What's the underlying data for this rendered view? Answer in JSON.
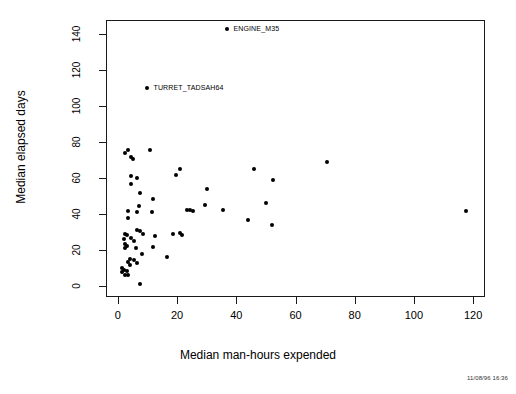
{
  "chart_data": {
    "type": "scatter",
    "title": "",
    "xlabel": "Median man-hours expended",
    "ylabel": "Median elapsed days",
    "xlim": [
      -4,
      124
    ],
    "ylim": [
      -6,
      148
    ],
    "xticks": [
      0,
      20,
      40,
      60,
      80,
      100,
      120
    ],
    "yticks": [
      0,
      20,
      40,
      60,
      80,
      100,
      120,
      140
    ],
    "grid": false,
    "legend": null,
    "marker": "filled-circle",
    "marker_color": "#000000",
    "points": [
      {
        "x": 37.0,
        "y": 143.0,
        "label": "ENGINE_M35"
      },
      {
        "x": 10.0,
        "y": 110.0,
        "label": "TURRET_TADSAH64"
      },
      {
        "x": 11.0,
        "y": 76.0,
        "label": ""
      },
      {
        "x": 3.5,
        "y": 76.0,
        "label": ""
      },
      {
        "x": 2.5,
        "y": 74.0,
        "label": ""
      },
      {
        "x": 4.5,
        "y": 72.0,
        "label": ""
      },
      {
        "x": 5.0,
        "y": 70.5,
        "label": ""
      },
      {
        "x": 70.5,
        "y": 69.0,
        "label": ""
      },
      {
        "x": 21.0,
        "y": 65.0,
        "label": ""
      },
      {
        "x": 46.0,
        "y": 65.0,
        "label": ""
      },
      {
        "x": 19.5,
        "y": 62.0,
        "label": ""
      },
      {
        "x": 4.5,
        "y": 61.0,
        "label": ""
      },
      {
        "x": 6.5,
        "y": 60.0,
        "label": ""
      },
      {
        "x": 52.5,
        "y": 59.0,
        "label": ""
      },
      {
        "x": 4.5,
        "y": 57.0,
        "label": ""
      },
      {
        "x": 30.0,
        "y": 54.0,
        "label": ""
      },
      {
        "x": 7.5,
        "y": 52.0,
        "label": ""
      },
      {
        "x": 12.0,
        "y": 48.5,
        "label": ""
      },
      {
        "x": 50.0,
        "y": 46.0,
        "label": ""
      },
      {
        "x": 29.5,
        "y": 45.0,
        "label": ""
      },
      {
        "x": 7.0,
        "y": 44.5,
        "label": ""
      },
      {
        "x": 23.5,
        "y": 42.5,
        "label": ""
      },
      {
        "x": 24.5,
        "y": 42.5,
        "label": ""
      },
      {
        "x": 25.5,
        "y": 42.0,
        "label": ""
      },
      {
        "x": 35.5,
        "y": 42.5,
        "label": ""
      },
      {
        "x": 117.5,
        "y": 42.0,
        "label": ""
      },
      {
        "x": 3.5,
        "y": 42.0,
        "label": ""
      },
      {
        "x": 11.5,
        "y": 41.5,
        "label": ""
      },
      {
        "x": 6.5,
        "y": 41.0,
        "label": ""
      },
      {
        "x": 3.5,
        "y": 38.0,
        "label": ""
      },
      {
        "x": 44.0,
        "y": 37.0,
        "label": ""
      },
      {
        "x": 52.0,
        "y": 34.0,
        "label": ""
      },
      {
        "x": 6.5,
        "y": 31.0,
        "label": ""
      },
      {
        "x": 7.5,
        "y": 30.5,
        "label": ""
      },
      {
        "x": 2.5,
        "y": 29.0,
        "label": ""
      },
      {
        "x": 3.0,
        "y": 28.5,
        "label": ""
      },
      {
        "x": 8.5,
        "y": 29.0,
        "label": ""
      },
      {
        "x": 12.5,
        "y": 28.0,
        "label": ""
      },
      {
        "x": 18.5,
        "y": 29.0,
        "label": ""
      },
      {
        "x": 21.0,
        "y": 29.5,
        "label": ""
      },
      {
        "x": 21.5,
        "y": 28.5,
        "label": ""
      },
      {
        "x": 4.5,
        "y": 27.0,
        "label": ""
      },
      {
        "x": 2.0,
        "y": 26.0,
        "label": ""
      },
      {
        "x": 5.5,
        "y": 25.0,
        "label": ""
      },
      {
        "x": 2.5,
        "y": 23.5,
        "label": ""
      },
      {
        "x": 3.0,
        "y": 22.5,
        "label": ""
      },
      {
        "x": 6.0,
        "y": 21.5,
        "label": ""
      },
      {
        "x": 12.0,
        "y": 22.0,
        "label": ""
      },
      {
        "x": 2.5,
        "y": 21.0,
        "label": ""
      },
      {
        "x": 8.0,
        "y": 18.0,
        "label": ""
      },
      {
        "x": 16.5,
        "y": 16.5,
        "label": ""
      },
      {
        "x": 4.0,
        "y": 15.0,
        "label": ""
      },
      {
        "x": 5.5,
        "y": 14.5,
        "label": ""
      },
      {
        "x": 3.5,
        "y": 13.5,
        "label": ""
      },
      {
        "x": 6.5,
        "y": 13.0,
        "label": ""
      },
      {
        "x": 4.0,
        "y": 12.0,
        "label": ""
      },
      {
        "x": 1.5,
        "y": 10.0,
        "label": ""
      },
      {
        "x": 2.0,
        "y": 9.0,
        "label": ""
      },
      {
        "x": 3.0,
        "y": 8.5,
        "label": ""
      },
      {
        "x": 1.5,
        "y": 8.0,
        "label": ""
      },
      {
        "x": 2.5,
        "y": 6.5,
        "label": ""
      },
      {
        "x": 3.5,
        "y": 6.0,
        "label": ""
      },
      {
        "x": 7.5,
        "y": 1.5,
        "label": ""
      }
    ]
  },
  "annotations": [
    {
      "text": "ENGINE_M35",
      "point_x": 37.0,
      "point_y": 143.0
    },
    {
      "text": "TURRET_TADSAH64",
      "point_x": 10.0,
      "point_y": 110.0
    }
  ],
  "footer": {
    "timestamp": "11/08/96 16:36"
  }
}
